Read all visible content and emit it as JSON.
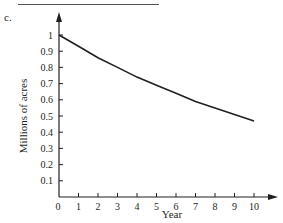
{
  "part_label": "c.",
  "chart_data": {
    "type": "line",
    "title": "",
    "xlabel": "Year",
    "ylabel": "Millions of acres",
    "x_ticks": [
      "0",
      "1",
      "2",
      "3",
      "4",
      "5",
      "6",
      "7",
      "8",
      "9",
      "10"
    ],
    "y_ticks": [
      "0.1",
      "0.2",
      "0.3",
      "0.4",
      "0.5",
      "0.6",
      "0.7",
      "0.8",
      "0.9",
      "1"
    ],
    "xlim": [
      0,
      10
    ],
    "ylim": [
      0,
      1
    ],
    "grid": false,
    "legend": null,
    "series": [
      {
        "name": "Millions of acres",
        "x": [
          0,
          1,
          2,
          3,
          4,
          5,
          6,
          7,
          8,
          9,
          10
        ],
        "values": [
          1.0,
          0.93,
          0.86,
          0.8,
          0.74,
          0.69,
          0.64,
          0.59,
          0.55,
          0.51,
          0.47
        ]
      }
    ]
  }
}
